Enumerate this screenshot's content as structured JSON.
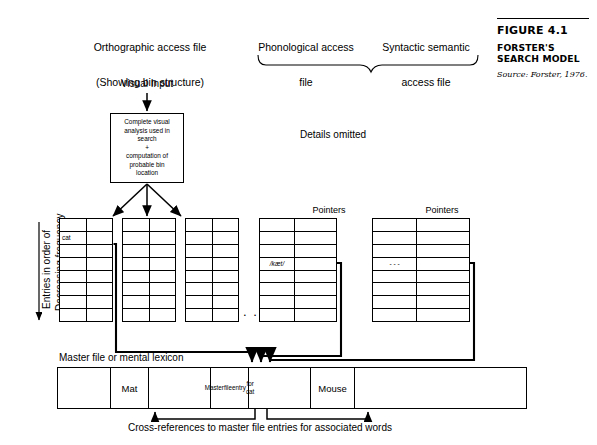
{
  "figure": {
    "number": "FIGURE 4.1",
    "title": "FORSTER'S SEARCH MODEL",
    "source": "Source: Forster, 1976."
  },
  "group_labels": {
    "orthographic_line1": "Orthographic access file",
    "orthographic_line2": "(Showing bin structure)",
    "phonological_line1": "Phonological access",
    "phonological_line2": "file",
    "syntactic_line1": "Syntactic semantic",
    "syntactic_line2": "access file"
  },
  "visual_input_label": "Visual Input",
  "process_box": {
    "line1": "Complete visual",
    "line2": "analysis used in",
    "line3": "search",
    "line4": "+",
    "line5": "computation of",
    "line6": "probable bin",
    "line7": "location"
  },
  "details_omitted": "Details omitted",
  "side_label": {
    "line1": "Entries in order of",
    "line2": "Decreasing frequency"
  },
  "ellipsis_bins": ". . .",
  "bins": [
    {
      "name": "bin-1",
      "rows": 8,
      "cols": 2,
      "entries": {
        "1": {
          "col": 0,
          "text": "cat"
        }
      }
    },
    {
      "name": "bin-2",
      "rows": 8,
      "cols": 2,
      "entries": {}
    },
    {
      "name": "bin-3",
      "rows": 8,
      "cols": 2,
      "entries": {}
    },
    {
      "name": "bin-4",
      "rows": 8,
      "cols": 2,
      "entries": {}
    }
  ],
  "access_tables": [
    {
      "name": "phonological-access-table",
      "header_codes_line1": "Access",
      "header_codes_line2": "Codes",
      "header_pointers": "Pointers",
      "rows": 8,
      "entries": {
        "3": {
          "col": 0,
          "text": "/kæt/",
          "italic": true
        }
      }
    },
    {
      "name": "syntactic-access-table",
      "header_codes_line1": "Access",
      "header_codes_line2": "Codes",
      "header_pointers": "Pointers",
      "rows": 8,
      "entries": {
        "3": {
          "col": 0,
          "text": "- - -",
          "italic": false
        }
      }
    }
  ],
  "master_file": {
    "label": "Master file or mental lexicon",
    "cells": [
      {
        "text": "",
        "width": 53
      },
      {
        "text": "Mat",
        "width": 38
      },
      {
        "text": "",
        "width": 62
      },
      {
        "text": "Master\nfile\nentry\nfor cat",
        "width": 38,
        "small": true
      },
      {
        "text": "",
        "width": 62
      },
      {
        "text": "Mouse",
        "width": 44
      },
      {
        "text": "",
        "width": 80
      }
    ]
  },
  "cross_ref_caption": "Cross-references to master file entries for associated words",
  "colors": {
    "ink": "#000000",
    "paper": "#ffffff"
  }
}
